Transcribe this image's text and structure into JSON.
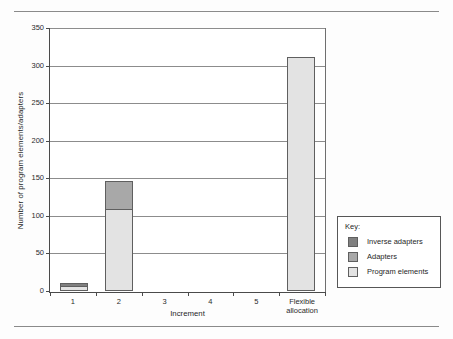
{
  "chart_data": {
    "type": "bar",
    "subtype": "stacked-bar",
    "title": "",
    "xlabel": "Increment",
    "ylabel": "Number of program elements/adapters",
    "categories": [
      "1",
      "2",
      "3",
      "4",
      "5",
      "Flexible allocation"
    ],
    "series": [
      {
        "name": "Program elements",
        "color": "#e3e3e3",
        "values": [
          6,
          108,
          0,
          0,
          0,
          309
        ]
      },
      {
        "name": "Adapters",
        "color": "#a8a8a8",
        "values": [
          0,
          37,
          0,
          0,
          0,
          0
        ]
      },
      {
        "name": "Inverse adapters",
        "color": "#808080",
        "values": [
          4,
          0,
          0,
          0,
          0,
          0
        ]
      }
    ],
    "totals": [
      10,
      145,
      0,
      0,
      0,
      309
    ],
    "ylim": [
      0,
      350
    ],
    "ytick_labels": [
      "0",
      "50",
      "100",
      "150",
      "200",
      "250",
      "300",
      "350"
    ],
    "ytick_values": [
      0,
      50,
      100,
      150,
      200,
      250,
      300,
      350
    ],
    "grid": true,
    "legend_position": "right"
  },
  "legend": {
    "title": "Key:",
    "entries": [
      {
        "label": "Inverse adapters",
        "color": "#808080"
      },
      {
        "label": "Adapters",
        "color": "#a8a8a8"
      },
      {
        "label": "Program elements",
        "color": "#e3e3e3"
      }
    ]
  }
}
